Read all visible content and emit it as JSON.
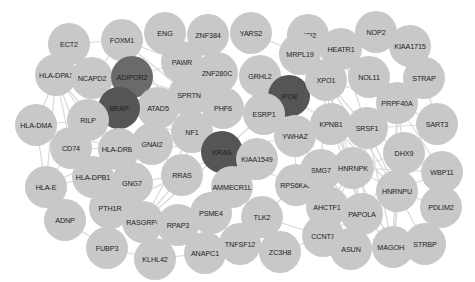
{
  "network": {
    "title": "",
    "colors": {
      "default_node": "#c8c8c8",
      "hub_node": "#555555",
      "hub_mid_node": "#6a6a6a",
      "edge": "#d9d9d9",
      "label": "#222222"
    },
    "nodes": [
      {
        "id": "ECT2",
        "x": 69,
        "y": 44
      },
      {
        "id": "FOXM1",
        "x": 122,
        "y": 40
      },
      {
        "id": "ENG",
        "x": 165,
        "y": 33
      },
      {
        "id": "ZNF384",
        "x": 208,
        "y": 35
      },
      {
        "id": "YARS2",
        "x": 251,
        "y": 33
      },
      {
        "id": "MSI2",
        "x": 308,
        "y": 35
      },
      {
        "id": "NOP2",
        "x": 376,
        "y": 32
      },
      {
        "id": "KIAA1715",
        "x": 410,
        "y": 46
      },
      {
        "id": "HLA-DPA1",
        "x": 56,
        "y": 75
      },
      {
        "id": "NCAPD2",
        "x": 92,
        "y": 78
      },
      {
        "id": "ADIPOR2",
        "x": 132,
        "y": 77,
        "type": "hub-mid"
      },
      {
        "id": "PAWR",
        "x": 182,
        "y": 62
      },
      {
        "id": "ZNF280C",
        "x": 217,
        "y": 73
      },
      {
        "id": "GRHL2",
        "x": 260,
        "y": 76
      },
      {
        "id": "MRPL19",
        "x": 300,
        "y": 54
      },
      {
        "id": "HEATR1",
        "x": 341,
        "y": 49
      },
      {
        "id": "NOL11",
        "x": 369,
        "y": 77
      },
      {
        "id": "STRAP",
        "x": 424,
        "y": 78
      },
      {
        "id": "IPO8",
        "x": 289,
        "y": 96,
        "type": "hub"
      },
      {
        "id": "XPO1",
        "x": 326,
        "y": 80
      },
      {
        "id": "ESRP1",
        "x": 264,
        "y": 114
      },
      {
        "id": "PHF6",
        "x": 223,
        "y": 108
      },
      {
        "id": "SPRTN",
        "x": 189,
        "y": 95
      },
      {
        "id": "ATAD5",
        "x": 158,
        "y": 108
      },
      {
        "id": "BRAP",
        "x": 119,
        "y": 108,
        "type": "hub"
      },
      {
        "id": "RILP",
        "x": 88,
        "y": 120
      },
      {
        "id": "HLA-DMA",
        "x": 36,
        "y": 125
      },
      {
        "id": "NF1",
        "x": 192,
        "y": 132
      },
      {
        "id": "KRAS",
        "x": 222,
        "y": 152,
        "type": "hub"
      },
      {
        "id": "KIAA1549",
        "x": 257,
        "y": 159
      },
      {
        "id": "YWHAZ",
        "x": 295,
        "y": 136
      },
      {
        "id": "KPNB1",
        "x": 331,
        "y": 124
      },
      {
        "id": "SRSF1",
        "x": 367,
        "y": 128
      },
      {
        "id": "PRPF40A",
        "x": 397,
        "y": 103
      },
      {
        "id": "SART3",
        "x": 437,
        "y": 124
      },
      {
        "id": "DHX9",
        "x": 404,
        "y": 153
      },
      {
        "id": "WBP11",
        "x": 442,
        "y": 172
      },
      {
        "id": "CD74",
        "x": 71,
        "y": 148
      },
      {
        "id": "HLA-DRB1",
        "x": 119,
        "y": 149
      },
      {
        "id": "GNAI2",
        "x": 152,
        "y": 144
      },
      {
        "id": "HLA-DPB1",
        "x": 93,
        "y": 177
      },
      {
        "id": "HLA-E",
        "x": 46,
        "y": 187
      },
      {
        "id": "GNG7",
        "x": 132,
        "y": 183
      },
      {
        "id": "RRAS",
        "x": 182,
        "y": 175
      },
      {
        "id": "AMMECR1L",
        "x": 232,
        "y": 187
      },
      {
        "id": "RPS6KA1",
        "x": 296,
        "y": 185
      },
      {
        "id": "SMG7",
        "x": 321,
        "y": 170
      },
      {
        "id": "HNRNPK",
        "x": 353,
        "y": 168
      },
      {
        "id": "HNRNPU",
        "x": 397,
        "y": 191
      },
      {
        "id": "AHCTF1",
        "x": 327,
        "y": 207
      },
      {
        "id": "PDLIM2",
        "x": 441,
        "y": 207
      },
      {
        "id": "ADNP",
        "x": 65,
        "y": 220
      },
      {
        "id": "PTH1R",
        "x": 110,
        "y": 208
      },
      {
        "id": "RASGRP4",
        "x": 143,
        "y": 222
      },
      {
        "id": "RPAP3",
        "x": 178,
        "y": 225
      },
      {
        "id": "PSME4",
        "x": 211,
        "y": 213
      },
      {
        "id": "TLK2",
        "x": 262,
        "y": 217
      },
      {
        "id": "PAPOLA",
        "x": 362,
        "y": 214
      },
      {
        "id": "CCNT1",
        "x": 323,
        "y": 236
      },
      {
        "id": "FUBP3",
        "x": 107,
        "y": 248
      },
      {
        "id": "KLHL42",
        "x": 155,
        "y": 259
      },
      {
        "id": "ANAPC1",
        "x": 205,
        "y": 253
      },
      {
        "id": "TNFSF12",
        "x": 240,
        "y": 244
      },
      {
        "id": "ZC3H8",
        "x": 280,
        "y": 252
      },
      {
        "id": "ASUN",
        "x": 351,
        "y": 249
      },
      {
        "id": "MAGOHB",
        "x": 393,
        "y": 247
      },
      {
        "id": "STRBP",
        "x": 425,
        "y": 244
      }
    ],
    "edges": [
      [
        "ECT2",
        "FOXM1"
      ],
      [
        "ECT2",
        "NCAPD2"
      ],
      [
        "FOXM1",
        "NCAPD2"
      ],
      [
        "FOXM1",
        "ADIPOR2"
      ],
      [
        "FOXM1",
        "PAWR"
      ],
      [
        "FOXM1",
        "SPRTN"
      ],
      [
        "FOXM1",
        "NF1"
      ],
      [
        "HLA-DPA1",
        "NCAPD2"
      ],
      [
        "HLA-DPA1",
        "HLA-DMA"
      ],
      [
        "HLA-DPA1",
        "CD74"
      ],
      [
        "HLA-DPA1",
        "HLA-DRB1"
      ],
      [
        "HLA-DPA1",
        "HLA-DPB1"
      ],
      [
        "HLA-DPA1",
        "HLA-E"
      ],
      [
        "HLA-DPA1",
        "RILP"
      ],
      [
        "NCAPD2",
        "BRAP"
      ],
      [
        "ADIPOR2",
        "PAWR"
      ],
      [
        "ADIPOR2",
        "SPRTN"
      ],
      [
        "ADIPOR2",
        "ATAD5"
      ],
      [
        "BRAP",
        "NF1"
      ],
      [
        "BRAP",
        "KRAS"
      ],
      [
        "BRAP",
        "ATAD5"
      ],
      [
        "HLA-DMA",
        "CD74"
      ],
      [
        "HLA-DMA",
        "HLA-DRB1"
      ],
      [
        "HLA-DMA",
        "HLA-DPB1"
      ],
      [
        "HLA-DMA",
        "HLA-E"
      ],
      [
        "HLA-DMA",
        "RILP"
      ],
      [
        "CD74",
        "HLA-DRB1"
      ],
      [
        "CD74",
        "HLA-DPB1"
      ],
      [
        "CD74",
        "HLA-E"
      ],
      [
        "HLA-DRB1",
        "HLA-DPB1"
      ],
      [
        "HLA-DRB1",
        "HLA-E"
      ],
      [
        "HLA-DPB1",
        "HLA-E"
      ],
      [
        "RILP",
        "HLA-DRB1"
      ],
      [
        "ZNF384",
        "ZNF280C"
      ],
      [
        "YARS2",
        "MRPL19"
      ],
      [
        "MRPL19",
        "IPO8"
      ],
      [
        "GRHL2",
        "ESRP1"
      ],
      [
        "ZNF280C",
        "PHF6"
      ],
      [
        "NF1",
        "KRAS"
      ],
      [
        "NF1",
        "RRAS"
      ],
      [
        "NF1",
        "GNAI2"
      ],
      [
        "GNAI2",
        "KRAS"
      ],
      [
        "GNAI2",
        "GNG7"
      ],
      [
        "GNAI2",
        "RRAS"
      ],
      [
        "GNAI2",
        "HLA-DRB1"
      ],
      [
        "KRAS",
        "RRAS"
      ],
      [
        "KRAS",
        "ESRP1"
      ],
      [
        "KRAS",
        "KIAA1549"
      ],
      [
        "KRAS",
        "YWHAZ"
      ],
      [
        "KRAS",
        "RASGRP4"
      ],
      [
        "KRAS",
        "PSME4"
      ],
      [
        "KRAS",
        "RPS6KA1"
      ],
      [
        "RRAS",
        "RASGRP4"
      ],
      [
        "RRAS",
        "GNG7"
      ],
      [
        "RRAS",
        "PTH1R"
      ],
      [
        "GNG7",
        "PTH1R"
      ],
      [
        "GNG7",
        "RASGRP4"
      ],
      [
        "IPO8",
        "KPNB1"
      ],
      [
        "IPO8",
        "XPO1"
      ],
      [
        "IPO8",
        "ESRP1"
      ],
      [
        "ESRP1",
        "YWHAZ"
      ],
      [
        "YWHAZ",
        "KPNB1"
      ],
      [
        "YWHAZ",
        "RPS6KA1"
      ],
      [
        "YWHAZ",
        "SMG7"
      ],
      [
        "HEATR1",
        "NOP2"
      ],
      [
        "HEATR1",
        "NOL11"
      ],
      [
        "HEATR1",
        "XPO1"
      ],
      [
        "HEATR1",
        "SRSF1"
      ],
      [
        "MSI2",
        "XPO1"
      ],
      [
        "KIAA1715",
        "STRAP"
      ],
      [
        "STRAP",
        "SART3"
      ],
      [
        "XPO1",
        "KPNB1"
      ],
      [
        "XPO1",
        "SRSF1"
      ],
      [
        "XPO1",
        "HNRNPK"
      ],
      [
        "XPO1",
        "HNRNPU"
      ],
      [
        "XPO1",
        "PRPF40A"
      ],
      [
        "XPO1",
        "PAPOLA"
      ],
      [
        "XPO1",
        "SMG7"
      ],
      [
        "KPNB1",
        "SRSF1"
      ],
      [
        "KPNB1",
        "HNRNPK"
      ],
      [
        "KPNB1",
        "HNRNPU"
      ],
      [
        "KPNB1",
        "PAPOLA"
      ],
      [
        "KPNB1",
        "MAGOHB"
      ],
      [
        "SRSF1",
        "PRPF40A"
      ],
      [
        "SRSF1",
        "HNRNPK"
      ],
      [
        "SRSF1",
        "HNRNPU"
      ],
      [
        "SRSF1",
        "DHX9"
      ],
      [
        "SRSF1",
        "MAGOHB"
      ],
      [
        "SRSF1",
        "PAPOLA"
      ],
      [
        "SRSF1",
        "SART3"
      ],
      [
        "PRPF40A",
        "SART3"
      ],
      [
        "PRPF40A",
        "DHX9"
      ],
      [
        "PRPF40A",
        "HNRNPU"
      ],
      [
        "PRPF40A",
        "HNRNPK"
      ],
      [
        "PRPF40A",
        "WBP11"
      ],
      [
        "PRPF40A",
        "MAGOHB"
      ],
      [
        "DHX9",
        "HNRNPK"
      ],
      [
        "DHX9",
        "HNRNPU"
      ],
      [
        "DHX9",
        "WBP11"
      ],
      [
        "DHX9",
        "PAPOLA"
      ],
      [
        "DHX9",
        "MAGOHB"
      ],
      [
        "SART3",
        "DHX9"
      ],
      [
        "HNRNPK",
        "HNRNPU"
      ],
      [
        "HNRNPK",
        "PAPOLA"
      ],
      [
        "HNRNPK",
        "MAGOHB"
      ],
      [
        "HNRNPK",
        "WBP11"
      ],
      [
        "HNRNPK",
        "SMG7"
      ],
      [
        "HNRNPK",
        "CCNT1"
      ],
      [
        "HNRNPK",
        "AHCTF1"
      ],
      [
        "HNRNPU",
        "PAPOLA"
      ],
      [
        "HNRNPU",
        "MAGOHB"
      ],
      [
        "HNRNPU",
        "WBP11"
      ],
      [
        "HNRNPU",
        "PDLIM2"
      ],
      [
        "HNRNPU",
        "STRBP"
      ],
      [
        "PAPOLA",
        "MAGOHB"
      ],
      [
        "PAPOLA",
        "CCNT1"
      ],
      [
        "PAPOLA",
        "ASUN"
      ],
      [
        "MAGOHB",
        "STRBP"
      ],
      [
        "MAGOHB",
        "ASUN"
      ],
      [
        "PDLIM2",
        "STRBP"
      ],
      [
        "CCNT1",
        "ZC3H8"
      ],
      [
        "CCNT1",
        "TLK2"
      ],
      [
        "CCNT1",
        "AHCTF1"
      ],
      [
        "AHCTF1",
        "RPS6KA1"
      ],
      [
        "SMG7",
        "PAPOLA"
      ],
      [
        "TLK2",
        "AMMECR1L"
      ],
      [
        "TLK2",
        "RPS6KA1"
      ],
      [
        "TLK2",
        "TNFSF12"
      ],
      [
        "ZC3H8",
        "TNFSF12"
      ],
      [
        "TNFSF12",
        "ANAPC1"
      ],
      [
        "TNFSF12",
        "PSME4"
      ],
      [
        "ANAPC1",
        "KLHL42"
      ],
      [
        "ANAPC1",
        "PSME4"
      ],
      [
        "PSME4",
        "AMMECR1L"
      ],
      [
        "ADNP",
        "FUBP3"
      ],
      [
        "FUBP3",
        "KLHL42"
      ],
      [
        "FUBP3",
        "PTH1R"
      ],
      [
        "NF1",
        "SPRTN"
      ],
      [
        "ATAD5",
        "SPRTN"
      ],
      [
        "PAWR",
        "SPRTN"
      ],
      [
        "RASGRP4",
        "NF1"
      ]
    ]
  }
}
